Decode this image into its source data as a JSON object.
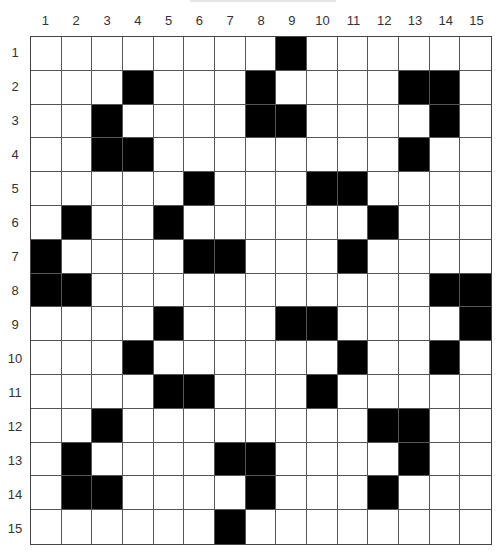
{
  "puzzle": {
    "rows": 15,
    "cols": 15,
    "column_labels": [
      "1",
      "2",
      "3",
      "4",
      "5",
      "6",
      "7",
      "8",
      "9",
      "10",
      "11",
      "12",
      "13",
      "14",
      "15"
    ],
    "row_labels": [
      "1",
      "2",
      "3",
      "4",
      "5",
      "6",
      "7",
      "8",
      "9",
      "10",
      "11",
      "12",
      "13",
      "14",
      "15"
    ],
    "black_cells": {
      "1": [
        9
      ],
      "2": [
        4,
        8,
        13,
        14
      ],
      "3": [
        3,
        8,
        9,
        14
      ],
      "4": [
        3,
        4,
        13
      ],
      "5": [
        6,
        10,
        11
      ],
      "6": [
        2,
        5,
        12
      ],
      "7": [
        1,
        6,
        7,
        11
      ],
      "8": [
        1,
        2,
        14,
        15
      ],
      "9": [
        5,
        9,
        10,
        15
      ],
      "10": [
        4,
        11,
        14
      ],
      "11": [
        5,
        6,
        10
      ],
      "12": [
        3,
        12,
        13
      ],
      "13": [
        2,
        7,
        8,
        13
      ],
      "14": [
        2,
        3,
        8,
        12
      ],
      "15": [
        7
      ]
    },
    "colors": {
      "black": "#000000",
      "white": "#ffffff",
      "line": "#555555"
    }
  }
}
